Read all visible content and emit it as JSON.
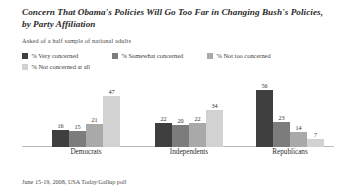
{
  "header": {
    "title": "Concern That Obama's Policies Will Go Too Far in Changing Bush's Policies, by Party Affiliation",
    "subtitle": "Asked of a half sample of national adults"
  },
  "footer": {
    "source": "June 15-19, 2008, USA Today/Gallup poll"
  },
  "legend": {
    "items": [
      {
        "label": "% Very concerned",
        "color": "#3f3f3f"
      },
      {
        "label": "% Somewhat concerned",
        "color": "#7c7c7c"
      },
      {
        "label": "% Not too concerned",
        "color": "#a9a9a9"
      },
      {
        "label": "% Not concerned at all",
        "color": "#d2d2d2"
      }
    ]
  },
  "chart_data": {
    "type": "bar",
    "title": "Concern That Obama's Policies Will Go Too Far in Changing Bush's Policies, by Party Affiliation",
    "subtitle": "Asked of a half sample of national adults",
    "categories": [
      "Democrats",
      "Independents",
      "Republicans"
    ],
    "series": [
      {
        "name": "% Very concerned",
        "color": "#3f3f3f",
        "values": [
          16,
          15,
          56
        ]
      },
      {
        "name": "% Somewhat concerned",
        "color": "#7c7c7c",
        "values": [
          15,
          20,
          23
        ]
      },
      {
        "name": "% Not too concerned",
        "color": "#a9a9a9",
        "values": [
          21,
          22,
          14
        ]
      },
      {
        "name": "% Not concerned at all",
        "color": "#d2d2d2",
        "values": [
          47,
          34,
          7
        ]
      }
    ],
    "xlabel": "",
    "ylabel": "",
    "ylim": [
      0,
      60
    ],
    "grid": false,
    "legend_position": "top",
    "groups": [
      {
        "name": "Democrats",
        "left": 30,
        "bars": [
          {
            "label": "% Very concerned",
            "value": 16,
            "color": "#3f3f3f"
          },
          {
            "label": "% Somewhat concerned",
            "value": 15,
            "color": "#7c7c7c"
          },
          {
            "label": "% Not too concerned",
            "value": 21,
            "color": "#a9a9a9"
          },
          {
            "label": "% Not concerned at all",
            "value": 47,
            "color": "#d2d2d2"
          }
        ]
      },
      {
        "name": "Independents",
        "left": 133,
        "bars": [
          {
            "label": "% Very concerned",
            "value": 22,
            "color": "#3f3f3f"
          },
          {
            "label": "% Somewhat concerned",
            "value": 20,
            "color": "#7c7c7c"
          },
          {
            "label": "% Not too concerned",
            "value": 22,
            "color": "#a9a9a9"
          },
          {
            "label": "% Not concerned at all",
            "value": 34,
            "color": "#d2d2d2"
          }
        ]
      },
      {
        "name": "Republicans",
        "left": 234,
        "bars": [
          {
            "label": "% Very concerned",
            "value": 56,
            "color": "#3f3f3f"
          },
          {
            "label": "% Somewhat concerned",
            "value": 23,
            "color": "#7c7c7c"
          },
          {
            "label": "% Not too concerned",
            "value": 14,
            "color": "#a9a9a9"
          },
          {
            "label": "% Not concerned at all",
            "value": 7,
            "color": "#d2d2d2"
          }
        ]
      }
    ]
  }
}
